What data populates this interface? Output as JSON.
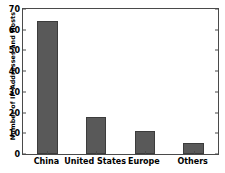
{
  "chart_data": {
    "type": "bar",
    "title": "",
    "xlabel": "",
    "ylabel": "Number of IP Addresses and Hosts",
    "categories": [
      "China",
      "United States",
      "Europe",
      "Others"
    ],
    "values": [
      64,
      18,
      11,
      5.5
    ],
    "ylim": [
      0,
      70
    ],
    "yticks": [
      0,
      10,
      20,
      30,
      40,
      50,
      60,
      70
    ],
    "ytick_labels": [
      "0",
      "10",
      "20",
      "30",
      "40",
      "50",
      "60",
      "70"
    ],
    "grid": false,
    "legend": null,
    "bar_color": "#595959",
    "bar_edge_color": "#3c3c3c",
    "axis_color": "#4a4a4a",
    "background_color": "#ffffff"
  }
}
